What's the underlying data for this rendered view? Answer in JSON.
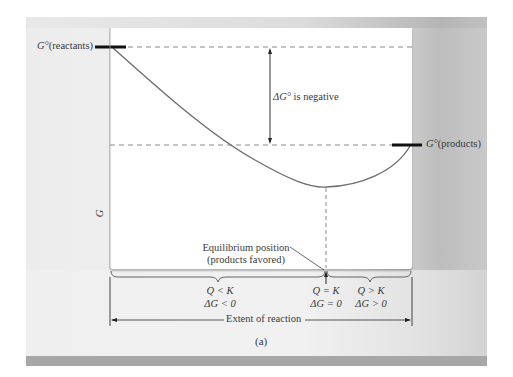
{
  "figure": {
    "panel_label": "(a)",
    "y_axis_label": "G",
    "x_axis_label": "Extent of reaction",
    "reactants_label_symbol": "G°",
    "reactants_label_text": "(reactants)",
    "products_label_symbol": "G°",
    "products_label_text": "(products)",
    "delta_label_symbol": "ΔG°",
    "delta_label_text": " is negative",
    "equilibrium_line1": "Equilibrium position",
    "equilibrium_line2": "(products favored)",
    "regions": [
      {
        "q_rel": "Q < K",
        "dg_rel": "ΔG < 0"
      },
      {
        "q_rel": "Q = K",
        "dg_rel": "ΔG = 0"
      },
      {
        "q_rel": "Q > K",
        "dg_rel": "ΔG > 0"
      }
    ]
  },
  "colors": {
    "curve": "#6e6e6e",
    "dashed": "#8a8a8a",
    "bar": "#111111",
    "bottom_bar": "#a7a7a7"
  }
}
